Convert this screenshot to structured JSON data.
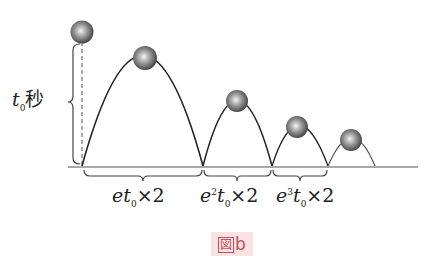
{
  "figure": {
    "caption_kanji": "図",
    "caption_letter": "b"
  },
  "height_label": {
    "var": "t",
    "sub": "0",
    "unit": "秒"
  },
  "intervals": [
    {
      "prefix": "e",
      "power": "",
      "var": "t",
      "sub": "0",
      "times": "×",
      "factor": "2"
    },
    {
      "prefix": "e",
      "power": "2",
      "var": "t",
      "sub": "0",
      "times": "×",
      "factor": "2"
    },
    {
      "prefix": "e",
      "power": "3",
      "var": "t",
      "sub": "0",
      "times": "×",
      "factor": "2"
    }
  ],
  "colors": {
    "line": "#333333",
    "caption_bg": "#fbe3e3",
    "caption_text": "#c0505a"
  }
}
